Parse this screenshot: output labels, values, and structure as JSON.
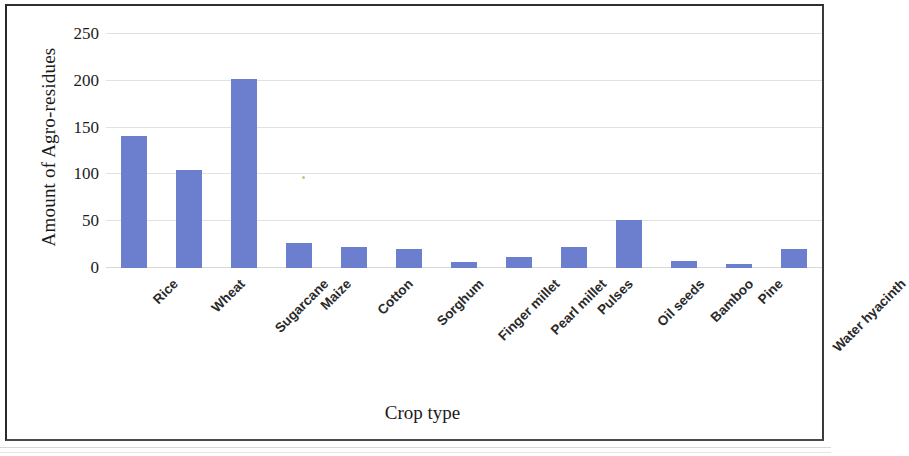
{
  "figure": {
    "frame_border_color": "#2a2a2a",
    "background_color": "#ffffff"
  },
  "chart_data": {
    "type": "bar",
    "title": "",
    "subtitle": "",
    "xlabel": "Crop type",
    "ylabel": "Amount of Agro-residues",
    "categories": [
      "Rice",
      "Wheat",
      "Sugarcane",
      "Maize",
      "Cotton",
      "Sorghum",
      "Finger millet",
      "Pearl millet",
      "Pulses",
      "Oil seeds",
      "Bamboo",
      "Pine",
      "Water hyacinth"
    ],
    "values": [
      141,
      105,
      202,
      27,
      22,
      20,
      6,
      12,
      22,
      51,
      7,
      4,
      20
    ],
    "series": [
      {
        "name": "Amount of Agro-residues",
        "values": [
          141,
          105,
          202,
          27,
          22,
          20,
          6,
          12,
          22,
          51,
          7,
          4,
          20
        ],
        "color": "#6B7FCE"
      }
    ],
    "ylim": [
      0,
      250
    ],
    "yticks": [
      0,
      50,
      100,
      150,
      200,
      250
    ],
    "ytick_labels": [
      "0",
      "50",
      "100",
      "150",
      "200",
      "250"
    ],
    "xtick_label_rotation": -45,
    "grid": true,
    "grid_axis": "y",
    "grid_color": "#e2e2e6",
    "legend": false,
    "legend_position": "none",
    "bar_color": "#6B7FCE"
  }
}
